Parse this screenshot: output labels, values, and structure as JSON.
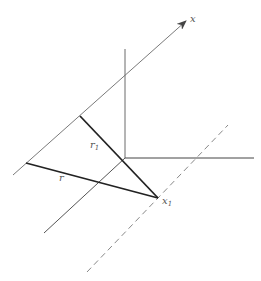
{
  "figure": {
    "type": "geometric-diagram",
    "colors": {
      "thin_line": "#7a7a7a",
      "bold_line": "#222222",
      "dashed_line": "#888888",
      "label": "#555555"
    }
  },
  "labels": {
    "x_axis": "x",
    "r1_main": "r",
    "r1_sub": "1",
    "r_main": "r",
    "x1_main": "x",
    "x1_sub": "1"
  },
  "lines": {
    "x_axis": {
      "x1": 13,
      "y1": 175,
      "x2": 186,
      "y2": 21
    },
    "vertical_axis": {
      "x1": 125,
      "y1": 49,
      "x2": 125,
      "y2": 158
    },
    "horizontal_axis": {
      "x1": 125,
      "y1": 158,
      "x2": 254,
      "y2": 158
    },
    "parallel_through_origin": {
      "x1": 44,
      "y1": 233,
      "x2": 125,
      "y2": 158
    },
    "r1_segment": {
      "x1": 80,
      "y1": 116,
      "x2": 158,
      "y2": 198
    },
    "r_segment": {
      "x1": 26,
      "y1": 163,
      "x2": 158,
      "y2": 198
    },
    "dashed_parallel": {
      "x1": 87,
      "y1": 272,
      "x2": 228,
      "y2": 125
    }
  }
}
